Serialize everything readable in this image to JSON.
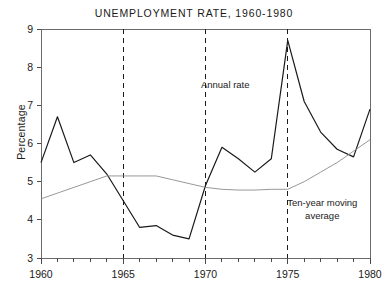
{
  "chart_data": {
    "type": "line",
    "title": "UNEMPLOYMENT RATE, 1960-1980",
    "xlabel": "",
    "ylabel": "Percentage",
    "xlim": [
      1960,
      1980
    ],
    "ylim": [
      3,
      9
    ],
    "grid": false,
    "legend_position": "inline-annotations",
    "x_ticks_major": [
      "1960",
      "1965",
      "1970",
      "1975",
      "1980"
    ],
    "x_ticks_major_values": [
      1960,
      1965,
      1970,
      1975,
      1980
    ],
    "x_ticks_minor_step": 1,
    "y_ticks": [
      "3",
      "4",
      "5",
      "6",
      "7",
      "8",
      "9"
    ],
    "y_tick_values": [
      3,
      4,
      5,
      6,
      7,
      8,
      9
    ],
    "x": [
      1960,
      1961,
      1962,
      1963,
      1964,
      1965,
      1966,
      1967,
      1968,
      1969,
      1970,
      1971,
      1972,
      1973,
      1974,
      1975,
      1976,
      1977,
      1978,
      1979,
      1980
    ],
    "series": [
      {
        "name": "Annual rate",
        "color": "#1a1a1a",
        "width": 1.2,
        "values": [
          5.5,
          6.7,
          5.5,
          5.7,
          5.2,
          4.5,
          3.8,
          3.85,
          3.6,
          3.5,
          4.9,
          5.9,
          5.6,
          5.25,
          5.6,
          8.7,
          7.1,
          6.3,
          5.85,
          5.65,
          6.9
        ]
      },
      {
        "name": "Ten-year moving average",
        "color": "#8c8c8c",
        "width": 0.9,
        "values": [
          4.55,
          4.7,
          4.85,
          5.0,
          5.15,
          5.15,
          5.15,
          5.15,
          5.05,
          4.95,
          4.85,
          4.8,
          4.78,
          4.78,
          4.8,
          4.8,
          5.0,
          5.25,
          5.5,
          5.8,
          6.1
        ]
      }
    ],
    "annotations": [
      {
        "text": "Annual rate",
        "x": 1971.2,
        "y": 7.45
      },
      {
        "text": "Ten-year moving",
        "x": 1977.1,
        "y": 4.35
      },
      {
        "text": "average",
        "x": 1977.1,
        "y": 4.03
      }
    ],
    "vertical_reference_lines": [
      {
        "x": 1965,
        "style": "dashed",
        "color": "#1a1a1a"
      },
      {
        "x": 1970,
        "style": "dashed",
        "color": "#1a1a1a"
      },
      {
        "x": 1975,
        "style": "dashed",
        "color": "#1a1a1a"
      }
    ]
  }
}
